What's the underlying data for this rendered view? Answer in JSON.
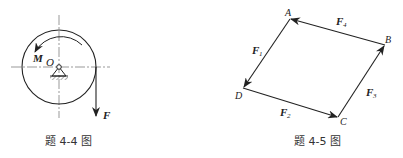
{
  "figures": [
    {
      "id": "4-4",
      "caption": "题 4-4 图",
      "labels": {
        "moment": "M",
        "center": "O",
        "force": "F"
      },
      "description": "Disk pivoted at center O with counter-clockwise moment M and a downward force F applied tangentially at the right edge"
    },
    {
      "id": "4-5",
      "caption": "题 4-5 图",
      "points": {
        "A": "A",
        "B": "B",
        "C": "C",
        "D": "D"
      },
      "forces": [
        {
          "label": "F",
          "sub": "1",
          "from": "A",
          "to": "D"
        },
        {
          "label": "F",
          "sub": "2",
          "from": "D",
          "to": "C"
        },
        {
          "label": "F",
          "sub": "3",
          "from": "C",
          "to": "B"
        },
        {
          "label": "F",
          "sub": "4",
          "from": "B",
          "to": "A"
        }
      ]
    }
  ],
  "colors": {
    "stroke": "#222222",
    "centerline": "#555555",
    "background": "#ffffff"
  }
}
